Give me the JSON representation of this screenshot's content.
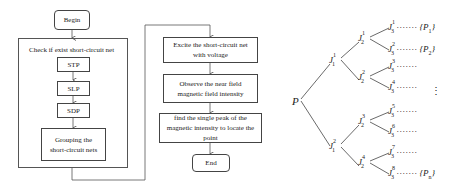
{
  "flowchart_left": {
    "begin": "Begin",
    "container_title": "Check if exist short-circuit net",
    "steps": [
      "STP",
      "SLP",
      "SDP"
    ],
    "grouping": "Grouping the short-circuit nets"
  },
  "flowchart_right": {
    "steps": [
      "Excite the short-circuit net with voltage",
      "Observe the near field magnetic field intensity",
      "find the single peak of the magnetic intensity to locate the point"
    ],
    "end": "End"
  },
  "tree": {
    "root": "P",
    "level1": [
      {
        "base": "J",
        "sup": "1",
        "sub": "1"
      },
      {
        "base": "J",
        "sup": "2",
        "sub": "1"
      }
    ],
    "level2": [
      {
        "base": "J",
        "sup": "1",
        "sub": "2"
      },
      {
        "base": "J",
        "sup": "2",
        "sub": "2"
      },
      {
        "base": "J",
        "sup": "3",
        "sub": "2"
      },
      {
        "base": "J",
        "sup": "4",
        "sub": "2"
      }
    ],
    "level3": [
      {
        "base": "J",
        "sup": "1",
        "sub": "3",
        "dots": "·······",
        "result": "{P",
        "result_sub": "1",
        "result_close": "}"
      },
      {
        "base": "J",
        "sup": "2",
        "sub": "3",
        "dots": "·······",
        "result": "{P",
        "result_sub": "2",
        "result_close": "}"
      },
      {
        "base": "J",
        "sup": "3",
        "sub": "3",
        "dots": "·······",
        "result": "",
        "result_sub": "",
        "result_close": ""
      },
      {
        "base": "J",
        "sup": "4",
        "sub": "3",
        "dots": "·······",
        "result": "",
        "result_sub": "",
        "result_close": ""
      },
      {
        "base": "J",
        "sup": "5",
        "sub": "3",
        "dots": "·······",
        "result": "",
        "result_sub": "",
        "result_close": ""
      },
      {
        "base": "J",
        "sup": "6",
        "sub": "3",
        "dots": "·······",
        "result": "",
        "result_sub": "",
        "result_close": ""
      },
      {
        "base": "J",
        "sup": "7",
        "sub": "3",
        "dots": "·······",
        "result": "",
        "result_sub": "",
        "result_close": ""
      },
      {
        "base": "J",
        "sup": "8",
        "sub": "3",
        "dots": "·······",
        "result": "{P",
        "result_sub": "n",
        "result_close": "}"
      }
    ],
    "vertical_ellipsis": "⋮"
  }
}
